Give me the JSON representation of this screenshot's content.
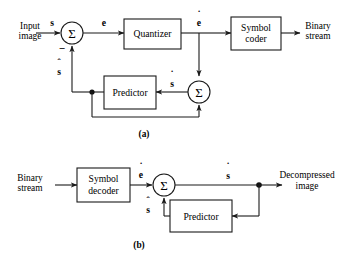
{
  "figure": {
    "panels": [
      {
        "id": "a",
        "caption": "(a)",
        "role": "encoder",
        "terminals": {
          "input_line1": "Input",
          "input_line2": "image",
          "output_line1": "Binary",
          "output_line2": "stream"
        },
        "blocks": [
          {
            "name": "quantizer",
            "label": "Quantizer"
          },
          {
            "name": "symbol-coder",
            "label_line1": "Symbol",
            "label_line2": "coder"
          },
          {
            "name": "predictor",
            "label": "Predictor"
          }
        ],
        "junctions": [
          {
            "name": "summer-1",
            "symbol": "Σ",
            "sign": "−"
          },
          {
            "name": "summer-2",
            "symbol": "Σ"
          }
        ],
        "signals": [
          {
            "name": "input-signal",
            "base": "s",
            "mark": "none"
          },
          {
            "name": "prediction-error",
            "base": "e",
            "mark": "none"
          },
          {
            "name": "quantized-error",
            "base": "e",
            "mark": "dot"
          },
          {
            "name": "predicted-sample",
            "base": "s",
            "mark": "hat"
          },
          {
            "name": "reconstructed-sample",
            "base": "s",
            "mark": "dot"
          }
        ]
      },
      {
        "id": "b",
        "caption": "(b)",
        "role": "decoder",
        "terminals": {
          "input_line1": "Binary",
          "input_line2": "stream",
          "output_line1": "Decompressed",
          "output_line2": "image"
        },
        "blocks": [
          {
            "name": "symbol-decoder",
            "label_line1": "Symbol",
            "label_line2": "decoder"
          },
          {
            "name": "predictor",
            "label": "Predictor"
          }
        ],
        "junctions": [
          {
            "name": "summer-1",
            "symbol": "Σ"
          }
        ],
        "signals": [
          {
            "name": "quantized-error",
            "base": "e",
            "mark": "dot"
          },
          {
            "name": "reconstructed-sample",
            "base": "s",
            "mark": "dot"
          },
          {
            "name": "predicted-sample",
            "base": "s",
            "mark": "hat"
          }
        ]
      }
    ],
    "marks": {
      "dot": "˙",
      "hat": "ˆ"
    },
    "colors": {
      "ink": "#1a1a1a",
      "background": "#ffffff"
    }
  }
}
